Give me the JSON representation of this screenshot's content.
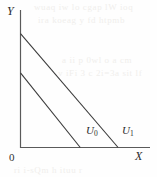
{
  "figure": {
    "background_color": "#fefefe",
    "line_color": "#3a3a3a",
    "axis_color": "#555555"
  },
  "axes": {
    "y_label": "Y",
    "x_label": "X",
    "origin_label": "0"
  },
  "curves": [
    {
      "name": "U0",
      "label_main": "U",
      "label_sub": "0"
    },
    {
      "name": "U1",
      "label_main": "U",
      "label_sub": "1"
    }
  ],
  "bleed_text": {
    "l1": "wuaq iw lo cgap lW ioq",
    "l2": "ira koeag y fd htpmb",
    "l3": "a ii p 0wl o a cm",
    "l4": "v iFi 3 c 2i=3a sit lf",
    "l5": "ri i-sQm h ituu r"
  },
  "chart_data": {
    "type": "line",
    "title": "",
    "xlabel": "X",
    "ylabel": "Y",
    "xlim": [
      0,
      130
    ],
    "ylim": [
      0,
      140
    ],
    "grid": false,
    "legend": "inline-at-curve",
    "series": [
      {
        "name": "U0",
        "x": [
          0,
          60
        ],
        "y": [
          76,
          0
        ],
        "description": "lower budget line, Y-intercept 76, X-intercept 60"
      },
      {
        "name": "U1",
        "x": [
          0,
          98
        ],
        "y": [
          116,
          0
        ],
        "description": "upper budget line, parallel to U0, Y-intercept 116, X-intercept 98"
      }
    ],
    "annotations": [
      {
        "text": "U0",
        "x": 68,
        "y": 9
      },
      {
        "text": "U1",
        "x": 105,
        "y": 9
      },
      {
        "text": "0",
        "x": -4,
        "y": -9
      }
    ]
  }
}
